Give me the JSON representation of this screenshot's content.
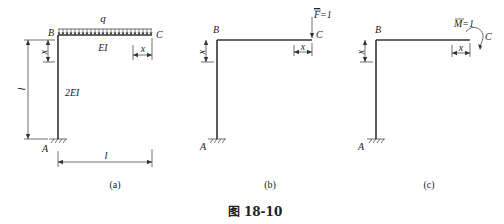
{
  "figure": {
    "caption": "图 18-10",
    "panels": [
      {
        "id": "a",
        "label": "(a)",
        "joint_top": "B",
        "joint_free": "C",
        "support": "A",
        "load_label": "q",
        "beam_stiffness": "EI",
        "column_stiffness": "2EI",
        "column_length": "l",
        "beam_length": "l",
        "coord_column": "x",
        "coord_beam": "x"
      },
      {
        "id": "b",
        "label": "(b)",
        "joint_top": "B",
        "joint_free": "C",
        "support": "A",
        "unit_load": "F=1",
        "unit_load_symbol": "F",
        "unit_load_value": "=1",
        "coord_column": "x",
        "coord_beam": "x"
      },
      {
        "id": "c",
        "label": "(c)",
        "joint_top": "B",
        "joint_free": "C",
        "support": "A",
        "unit_moment": "M=1",
        "unit_moment_symbol": "M",
        "unit_moment_value": "=1",
        "coord_column": "x",
        "coord_beam": "x"
      }
    ]
  }
}
